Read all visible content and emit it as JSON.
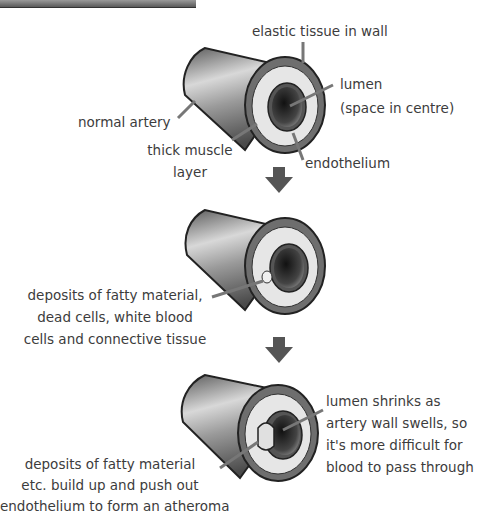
{
  "colors": {
    "background": "#ffffff",
    "text": "#3c3c3c",
    "arrow": "#555555",
    "artery_outer": "#8a8a8a",
    "muscle_layer": "#e4e4e4",
    "wall": "#6e6e6e",
    "lumen": "#2a2a2a"
  },
  "stages": [
    {
      "name": "normal artery",
      "labels": {
        "elastic": "elastic tissue in wall",
        "lumen_1": "lumen",
        "lumen_2": "(space in centre)",
        "normal": "normal artery",
        "muscle_1": "thick muscle",
        "muscle_2": "layer",
        "endothelium": "endothelium"
      }
    },
    {
      "name": "deposits forming",
      "labels": {
        "line1": "deposits of fatty material,",
        "line2": "dead cells, white blood",
        "line3": "cells and connective tissue"
      }
    },
    {
      "name": "atheroma",
      "labels": {
        "right1": "lumen shrinks as",
        "right2": "artery wall swells, so",
        "right3": "it's more difficult for",
        "right4": "blood to pass through",
        "left1": "deposits of fatty material",
        "left2": "etc. build up and push out",
        "left3": "endothelium to form an atheroma"
      }
    }
  ],
  "arrows": [
    "down-arrow-1",
    "down-arrow-2"
  ]
}
